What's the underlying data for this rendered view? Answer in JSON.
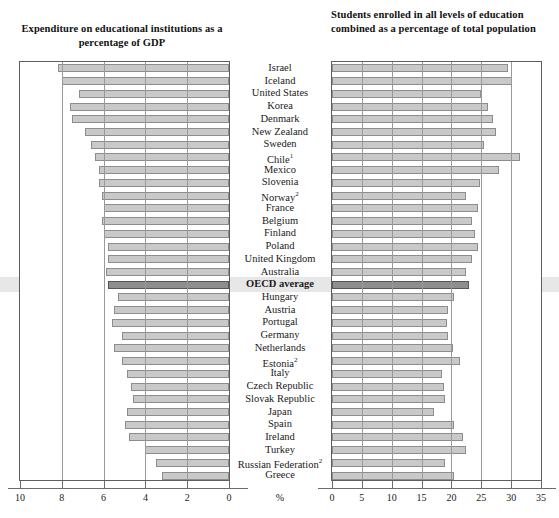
{
  "titles": {
    "left": "Expenditure on educational institutions as a percentage of GDP",
    "right": "Students enrolled in all levels of education combined as a percentage of total population"
  },
  "axis": {
    "percent_symbol": "%",
    "left_ticks": [
      "10",
      "8",
      "6",
      "4",
      "2",
      "0"
    ],
    "right_ticks": [
      "0",
      "5",
      "10",
      "15",
      "20",
      "25",
      "30",
      "35"
    ]
  },
  "colors": {
    "bar_fill": "#c9c9c9",
    "bar_stroke": "#8d8d8d",
    "oecd_bar_fill": "#8e8e8e",
    "oecd_band": "#d9d9d9",
    "panel_border": "#5d5d5d",
    "gridline": "#9a9a9a"
  },
  "chart_data": {
    "type": "bar",
    "orientation": "horizontal",
    "layout": "back-to-back pyramid (left panel reversed)",
    "grid": true,
    "legend_position": "none",
    "highlight_row": "OECD average",
    "categories": [
      "Israel",
      "Iceland",
      "United States",
      "Korea",
      "Denmark",
      "New Zealand",
      "Sweden",
      "Chile¹",
      "Mexico",
      "Slovenia",
      "Norway²",
      "France",
      "Belgium",
      "Finland",
      "Poland",
      "United Kingdom",
      "Australia",
      "OECD average",
      "Hungary",
      "Austria",
      "Portugal",
      "Germany",
      "Netherlands",
      "Estonia²",
      "Italy",
      "Czech Republic",
      "Slovak Republic",
      "Japan",
      "Spain",
      "Ireland",
      "Turkey",
      "Russian Federation²",
      "Greece"
    ],
    "category_footnotes": {
      "Chile": "1",
      "Norway": "2",
      "Estonia": "2",
      "Russian Federation": "2"
    },
    "series": [
      {
        "name": "Expenditure on educational institutions as a percentage of GDP",
        "panel": "left",
        "xlabel": "%",
        "xlim": [
          0,
          10
        ],
        "axis_direction": "reversed",
        "values": [
          8.2,
          8.0,
          7.2,
          7.6,
          7.5,
          6.9,
          6.6,
          6.4,
          6.2,
          6.2,
          6.1,
          6.0,
          6.1,
          6.0,
          5.8,
          5.8,
          5.9,
          5.8,
          5.3,
          5.5,
          5.6,
          5.1,
          5.5,
          5.1,
          4.9,
          4.7,
          4.6,
          4.9,
          5.0,
          4.8,
          4.0,
          3.5,
          3.2
        ]
      },
      {
        "name": "Students enrolled in all levels of education combined as a percentage of total population",
        "panel": "right",
        "xlabel": "%",
        "xlim": [
          0,
          35
        ],
        "axis_direction": "normal",
        "values": [
          29.5,
          30.2,
          25.0,
          26.2,
          27.0,
          27.5,
          25.5,
          31.5,
          28.0,
          24.8,
          22.5,
          24.5,
          23.5,
          24.0,
          24.5,
          23.5,
          22.5,
          23.0,
          20.5,
          19.5,
          19.3,
          19.5,
          20.2,
          21.5,
          18.5,
          18.8,
          19.0,
          17.0,
          20.5,
          22.0,
          22.5,
          19.0,
          20.5
        ]
      }
    ]
  }
}
